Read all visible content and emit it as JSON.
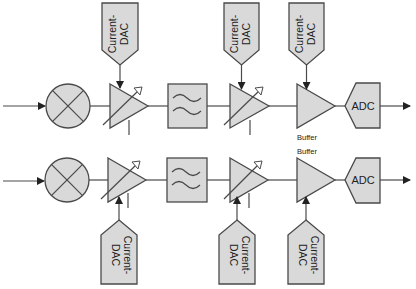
{
  "diagram": {
    "rows": [
      {
        "id": "top",
        "blocks": [
          "mixer",
          "variable-gain-amplifier",
          "low-pass-filter",
          "variable-gain-amplifier",
          "buffer",
          "adc"
        ],
        "dac_position": "above",
        "buffer_label": "Buffer",
        "adc_label": "ADC",
        "dacs": [
          {
            "label_line1": "Current-",
            "label_line2": "DAC",
            "controls": "amplifier-1"
          },
          {
            "label_line1": "Current-",
            "label_line2": "DAC",
            "controls": "amplifier-2"
          },
          {
            "label_line1": "Current-",
            "label_line2": "DAC",
            "controls": "buffer"
          }
        ]
      },
      {
        "id": "bottom",
        "blocks": [
          "mixer",
          "variable-gain-amplifier",
          "low-pass-filter",
          "variable-gain-amplifier",
          "buffer",
          "adc"
        ],
        "dac_position": "below",
        "buffer_label": "Buffer",
        "adc_label": "ADC",
        "dacs": [
          {
            "label_line1": "Current-",
            "label_line2": "DAC",
            "controls": "amplifier-1"
          },
          {
            "label_line1": "Current-",
            "label_line2": "DAC",
            "controls": "amplifier-2"
          },
          {
            "label_line1": "Current-",
            "label_line2": "DAC",
            "controls": "buffer"
          }
        ]
      }
    ],
    "colors": {
      "block_fill": "#d9d9d9",
      "stroke": "#4a4a4a",
      "text": "#222222"
    }
  }
}
